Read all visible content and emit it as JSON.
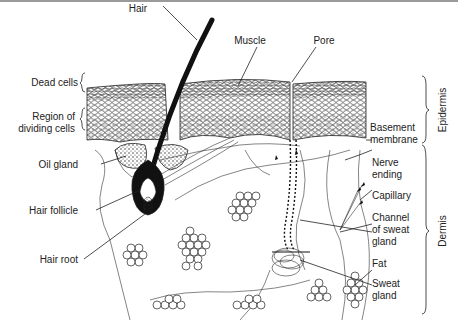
{
  "diagram": {
    "labels": {
      "hair": "Hair",
      "muscle": "Muscle",
      "pore": "Pore",
      "dead_cells": "Dead cells",
      "dividing_1": "Region of",
      "dividing_2": "dividing cells",
      "oil_gland": "Oil gland",
      "hair_follicle": "Hair follicle",
      "hair_root": "Hair root",
      "basement_1": "Basement",
      "basement_2": "membrane",
      "nerve_1": "Nerve",
      "nerve_2": "ending",
      "capillary": "Capillary",
      "channel_1": "Channel",
      "channel_2": "of sweat",
      "channel_3": "gland",
      "fat": "Fat",
      "sweat_1": "Sweat",
      "sweat_2": "gland",
      "epidermis": "Epidermis",
      "dermis": "Dermis"
    },
    "colors": {
      "ink": "#222222",
      "background": "#ffffff"
    }
  }
}
